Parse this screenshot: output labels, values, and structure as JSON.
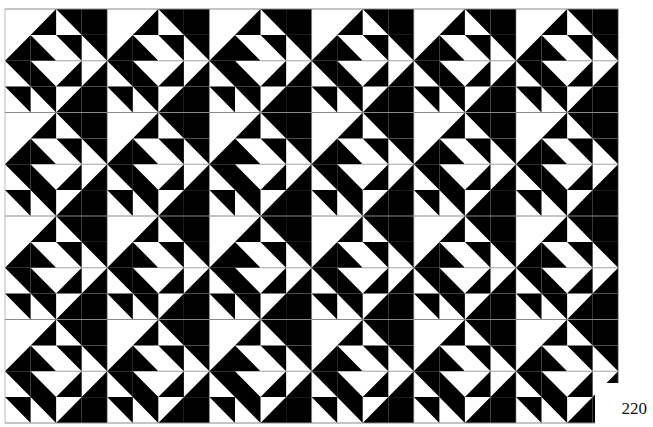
{
  "page": {
    "number": "220"
  },
  "pattern": {
    "origin": [
      5,
      9
    ],
    "tile_size": [
      102.2,
      103.5
    ],
    "columns": 6,
    "rows": 4,
    "subgrid": 4,
    "colors": {
      "ink": "#000000",
      "paper": "#ffffff",
      "grid_line": "#8a8a8a"
    },
    "tile_cells": [
      [
        "W",
        "ur",
        "ul",
        "B"
      ],
      [
        "ur",
        "dl",
        "ul",
        "ul"
      ],
      [
        "ul",
        "dl",
        "ur",
        "ur"
      ],
      [
        "ul",
        "ul",
        "ur",
        "B"
      ]
    ],
    "cell_legend": {
      "W": "solid white",
      "B": "solid black",
      "ur": "diagonal bottom-left to top-right, black lower-right half",
      "ul": "diagonal top-left to bottom-right, black upper-right half",
      "dl": "diagonal top-left to bottom-right, black lower-left half",
      "dr": "diagonal bottom-left to top-right, black upper-left half"
    },
    "clip_box": {
      "x": 595,
      "y": 383,
      "w": 58,
      "h": 44
    }
  }
}
